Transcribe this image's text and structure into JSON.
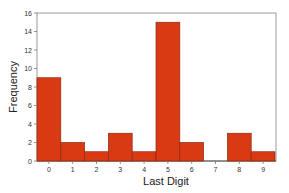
{
  "chart_data": {
    "type": "bar",
    "title": "",
    "xlabel": "Last Digit",
    "ylabel": "Frequency",
    "categories": [
      "0",
      "1",
      "2",
      "3",
      "4",
      "5",
      "6",
      "7",
      "8",
      "9"
    ],
    "values": [
      9,
      2,
      1,
      3,
      1,
      15,
      2,
      0,
      3,
      1
    ],
    "ylim": [
      0,
      16
    ],
    "yticks": [
      0,
      2,
      4,
      6,
      8,
      10,
      12,
      14,
      16
    ],
    "grid": false,
    "legend": null,
    "bar_color": "#d93a14",
    "bar_edge_color": "#8a2a10"
  }
}
